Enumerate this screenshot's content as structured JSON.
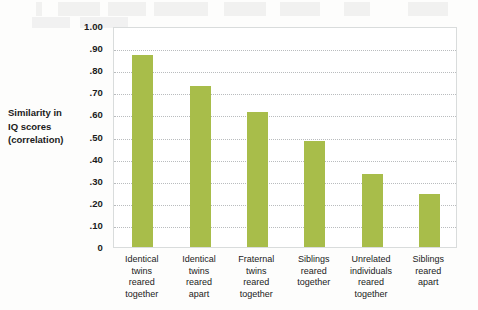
{
  "chart_data": {
    "type": "bar",
    "title": "",
    "xlabel": "",
    "ylabel": "Similarity in IQ scores (correlation)",
    "ylim": [
      0,
      1.0
    ],
    "grid": true,
    "legend": "none",
    "bar_color": "#a8bd4a",
    "categories": [
      "Identical twins reared together",
      "Identical twins reared apart",
      "Fraternal twins reared together",
      "Siblings reared together",
      "Unrelated individuals reared together",
      "Siblings reared apart"
    ],
    "category_lines": [
      [
        "Identical",
        "twins",
        "reared",
        "together"
      ],
      [
        "Identical",
        "twins",
        "reared",
        "apart"
      ],
      [
        "Fraternal",
        "twins",
        "reared",
        "together"
      ],
      [
        "Siblings",
        "reared",
        "together"
      ],
      [
        "Unrelated",
        "individuals",
        "reared",
        "together"
      ],
      [
        "Siblings",
        "reared",
        "apart"
      ]
    ],
    "values": [
      0.87,
      0.73,
      0.61,
      0.48,
      0.33,
      0.24
    ],
    "ytick_values": [
      1.0,
      0.9,
      0.8,
      0.7,
      0.6,
      0.5,
      0.4,
      0.3,
      0.2,
      0.1,
      0
    ],
    "ytick_labels": [
      "1.00",
      ".90",
      ".80",
      ".70",
      ".60",
      ".50",
      ".40",
      ".30",
      ".20",
      ".10",
      "0"
    ]
  },
  "axis_title": {
    "line1": "Similarity in",
    "line2": "IQ scores",
    "line3": "(correlation)"
  }
}
